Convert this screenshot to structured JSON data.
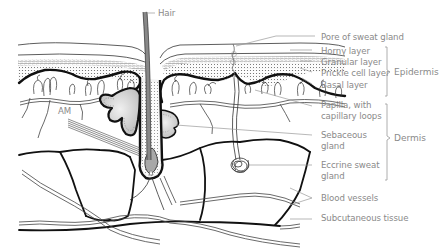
{
  "diagram": {
    "labels": {
      "hair": "Hair",
      "am": "AM",
      "pore": "Pore of sweat gland",
      "horny": "Horny layer",
      "granular": "Granular layer",
      "prickle": "Prickle cell layer",
      "basal": "Basal layer",
      "papilla_1": "Papilla, with",
      "papilla_2": "capillary loops",
      "sebaceous_1": "Sebaceous",
      "sebaceous_2": "gland",
      "eccrine_1": "Eccrine sweat",
      "eccrine_2": "gland",
      "blood": "Blood vessels",
      "subcutaneous": "Subcutaneous tissue"
    },
    "groups": {
      "epidermis": "Epidermis",
      "dermis": "Dermis"
    },
    "colors": {
      "ink": "#111111",
      "label": "#8a8a8a",
      "gland_fill": "#d6d6d6",
      "hair_fill": "#9a9a9a",
      "background": "#ffffff"
    }
  }
}
